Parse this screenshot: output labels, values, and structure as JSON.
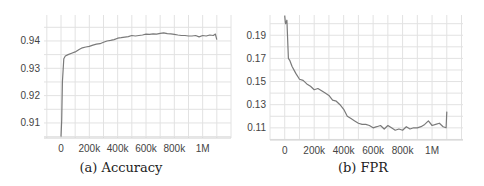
{
  "chart_data": [
    {
      "type": "line",
      "title": "",
      "caption": "(a) Accuracy",
      "xlabel": "",
      "ylabel": "",
      "x_ticks": [
        "0",
        "200k",
        "400k",
        "600k",
        "800k",
        "1M"
      ],
      "y_ticks": [
        "0.91",
        "0.92",
        "0.93",
        "0.94"
      ],
      "xlim": [
        -120000,
        1200000
      ],
      "ylim": [
        0.9045,
        0.9495
      ],
      "grid": true,
      "legend": null,
      "series": [
        {
          "name": "Accuracy",
          "color": "#7a7a7a",
          "x": [
            0,
            5000,
            10000,
            20000,
            30000,
            50000,
            75000,
            100000,
            125000,
            150000,
            175000,
            200000,
            225000,
            250000,
            275000,
            300000,
            325000,
            350000,
            375000,
            400000,
            425000,
            450000,
            475000,
            500000,
            525000,
            550000,
            575000,
            600000,
            625000,
            650000,
            675000,
            700000,
            725000,
            750000,
            775000,
            800000,
            825000,
            850000,
            875000,
            900000,
            925000,
            950000,
            975000,
            1000000,
            1025000,
            1050000,
            1075000,
            1090000,
            1100000
          ],
          "y": [
            0.905,
            0.911,
            0.925,
            0.9335,
            0.9345,
            0.935,
            0.9355,
            0.936,
            0.9368,
            0.9375,
            0.9378,
            0.938,
            0.9385,
            0.9388,
            0.939,
            0.9395,
            0.94,
            0.9402,
            0.9405,
            0.941,
            0.9412,
            0.9414,
            0.9416,
            0.942,
            0.9418,
            0.942,
            0.9422,
            0.9425,
            0.9424,
            0.9426,
            0.9425,
            0.9428,
            0.943,
            0.9427,
            0.9426,
            0.9424,
            0.9422,
            0.942,
            0.942,
            0.9418,
            0.9418,
            0.942,
            0.9415,
            0.942,
            0.9418,
            0.9422,
            0.942,
            0.9425,
            0.9405
          ]
        }
      ]
    },
    {
      "type": "line",
      "title": "",
      "caption": "(b) FPR",
      "xlabel": "",
      "ylabel": "",
      "x_ticks": [
        "0",
        "200k",
        "400k",
        "600k",
        "800k",
        "1M"
      ],
      "y_ticks": [
        "0.11",
        "0.13",
        "0.15",
        "0.17",
        "0.19"
      ],
      "xlim": [
        -100000,
        1210000
      ],
      "ylim": [
        0.0995,
        0.2075
      ],
      "grid": true,
      "legend": null,
      "series": [
        {
          "name": "FPR",
          "color": "#7a7a7a",
          "x": [
            0,
            5000,
            15000,
            25000,
            35000,
            50000,
            75000,
            100000,
            125000,
            150000,
            175000,
            200000,
            225000,
            250000,
            275000,
            300000,
            325000,
            350000,
            375000,
            400000,
            425000,
            450000,
            475000,
            500000,
            525000,
            550000,
            575000,
            600000,
            625000,
            650000,
            675000,
            700000,
            725000,
            750000,
            775000,
            800000,
            825000,
            850000,
            875000,
            900000,
            925000,
            950000,
            975000,
            1000000,
            1025000,
            1050000,
            1075000,
            1095000,
            1100000
          ],
          "y": [
            0.207,
            0.2,
            0.203,
            0.17,
            0.168,
            0.163,
            0.157,
            0.152,
            0.151,
            0.148,
            0.146,
            0.143,
            0.144,
            0.142,
            0.14,
            0.138,
            0.134,
            0.133,
            0.13,
            0.126,
            0.12,
            0.118,
            0.116,
            0.114,
            0.113,
            0.113,
            0.112,
            0.11,
            0.111,
            0.112,
            0.109,
            0.112,
            0.11,
            0.108,
            0.109,
            0.108,
            0.111,
            0.109,
            0.11,
            0.11,
            0.111,
            0.113,
            0.116,
            0.112,
            0.113,
            0.114,
            0.111,
            0.11,
            0.124
          ]
        }
      ]
    }
  ]
}
